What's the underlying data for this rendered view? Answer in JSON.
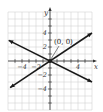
{
  "chart_data": {
    "type": "line",
    "title": "",
    "xlabel": "x",
    "ylabel": "y",
    "xlim": [
      -6,
      6
    ],
    "ylim": [
      -7,
      7
    ],
    "grid": true,
    "x_ticks": [
      -4,
      -2,
      2,
      4
    ],
    "x_tick_labels": [
      "−4",
      "−2",
      "",
      "4"
    ],
    "y_ticks": [
      -4,
      -2,
      2,
      4
    ],
    "y_tick_labels": [
      "−4",
      "−2",
      "2",
      "4"
    ],
    "series": [
      {
        "name": "rising line",
        "slope": 0.6667,
        "intercept": 0,
        "x": [
          -5.7,
          6
        ],
        "y": [
          -3.8,
          4
        ],
        "arrows": "both"
      },
      {
        "name": "falling line",
        "slope": -0.5,
        "intercept": 0,
        "x": [
          -5.9,
          6
        ],
        "y": [
          2.95,
          -3
        ],
        "arrows": "both"
      }
    ],
    "annotations": [
      {
        "text": "(0, 0)",
        "x": 0,
        "y": 0,
        "point": true
      }
    ]
  },
  "labels": {
    "x_axis": "x",
    "y_axis": "y",
    "origin_annotation": "(0, 0)"
  }
}
